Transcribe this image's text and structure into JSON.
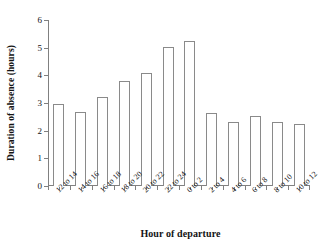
{
  "chart_data": {
    "type": "bar",
    "title": "",
    "xlabel": "Hour of departure",
    "ylabel": "Duration of absence (hours)",
    "categories": [
      "12 to 14",
      "14 to 16",
      "16 to 18",
      "18 to 20",
      "20 to 22",
      "22 to 24",
      "0 to 2",
      "2 to 4",
      "4 to 6",
      "6 to 8",
      "8 to 10",
      "10 to 12"
    ],
    "values": [
      2.97,
      2.67,
      3.22,
      3.8,
      4.08,
      5.02,
      5.23,
      2.63,
      2.33,
      2.52,
      2.33,
      2.23
    ],
    "ylim": [
      0,
      6
    ],
    "yticks": [
      0,
      1,
      2,
      3,
      4,
      5,
      6
    ],
    "ytick_labels": [
      "0",
      "1",
      "2",
      "3",
      "4",
      "5",
      "6"
    ],
    "grid": false,
    "legend": false,
    "bar_facecolor": "#ffffff",
    "bar_edgecolor": "#8a8a8a",
    "axis_color": "#808080",
    "text_color": "#141414",
    "background": "#ffffff"
  }
}
